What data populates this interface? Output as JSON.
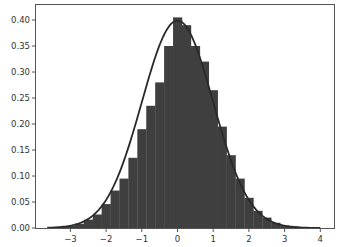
{
  "chart_data": {
    "type": "bar",
    "subtype": "histogram_with_density_curve",
    "title": "",
    "xlabel": "",
    "ylabel": "",
    "xlim": [
      -3.9,
      4.2
    ],
    "ylim": [
      0.0,
      0.43
    ],
    "grid": false,
    "legend": null,
    "x_ticks": [
      -3,
      -2,
      -1,
      0,
      1,
      2,
      3,
      4
    ],
    "x_tick_labels": [
      "−3",
      "−2",
      "−1",
      "0",
      "1",
      "2",
      "3",
      "4"
    ],
    "y_ticks": [
      0.0,
      0.05,
      0.1,
      0.15,
      0.2,
      0.25,
      0.3,
      0.35,
      0.4
    ],
    "y_tick_labels": [
      "0.00",
      "0.05",
      "0.10",
      "0.15",
      "0.20",
      "0.25",
      "0.30",
      "0.35",
      "0.40"
    ],
    "bin_width": 0.25,
    "bins_left_edges": [
      -3.625,
      -3.375,
      -3.125,
      -2.875,
      -2.625,
      -2.375,
      -2.125,
      -1.875,
      -1.625,
      -1.375,
      -1.125,
      -0.875,
      -0.625,
      -0.375,
      -0.125,
      0.125,
      0.375,
      0.625,
      0.875,
      1.125,
      1.375,
      1.625,
      1.875,
      2.125,
      2.375,
      2.625,
      2.875,
      3.125,
      3.375,
      3.625
    ],
    "values": [
      0.001,
      0.002,
      0.004,
      0.008,
      0.016,
      0.026,
      0.046,
      0.072,
      0.095,
      0.135,
      0.19,
      0.235,
      0.28,
      0.35,
      0.405,
      0.39,
      0.35,
      0.32,
      0.265,
      0.195,
      0.14,
      0.095,
      0.058,
      0.033,
      0.02,
      0.01,
      0.005,
      0.003,
      0.001,
      0.001
    ],
    "curve": {
      "type": "line",
      "name": "normal_pdf",
      "mean": 0.0,
      "std": 1.0,
      "color": "#2a2a2a"
    },
    "bar_color": "#3f3f3f",
    "bar_edge_color": "#3f3f3f"
  },
  "plot": {
    "left": 35,
    "top": 4,
    "right": 334,
    "bottom": 228,
    "x_zero_px": 177.5,
    "px_per_x": 35.7,
    "px_per_y": 520
  }
}
